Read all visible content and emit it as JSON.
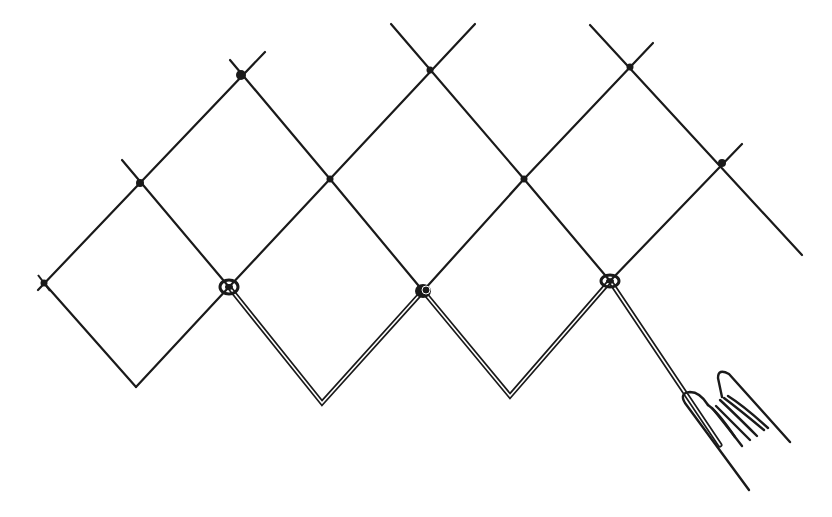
{
  "figure": {
    "title": "",
    "colors": {
      "ink": "#1a1a1a",
      "background": "#ffffff"
    }
  },
  "knots": [
    {
      "kind": "small",
      "x": 44,
      "y": 283
    },
    {
      "kind": "small",
      "x": 140,
      "y": 183
    },
    {
      "kind": "small",
      "x": 241,
      "y": 75
    },
    {
      "kind": "small",
      "x": 330,
      "y": 179
    },
    {
      "kind": "small",
      "x": 430,
      "y": 70
    },
    {
      "kind": "small",
      "x": 524,
      "y": 179
    },
    {
      "kind": "small",
      "x": 630,
      "y": 67
    },
    {
      "kind": "small",
      "x": 722,
      "y": 163
    },
    {
      "kind": "large",
      "x": 229,
      "y": 287
    },
    {
      "kind": "large",
      "x": 423,
      "y": 291
    },
    {
      "kind": "large",
      "x": 610,
      "y": 281
    }
  ],
  "elements": {
    "hand_icon": "hand-gripping-cord"
  }
}
